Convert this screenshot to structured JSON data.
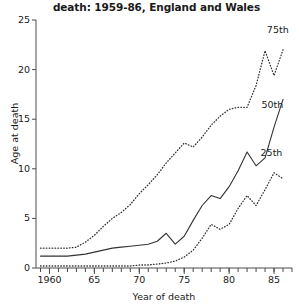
{
  "chart_data": {
    "type": "line",
    "title": "death: 1959-86, England and Wales",
    "subtitle": "",
    "xlabel": "Year of death",
    "ylabel": "Age at death",
    "xlim": [
      1958.5,
      1987.0
    ],
    "ylim": [
      0,
      25
    ],
    "grid": false,
    "legend_position": "inline-right",
    "y_ticks": [
      0,
      5,
      10,
      15,
      20,
      25
    ],
    "y_tick_labels": [
      "0",
      "5",
      "10",
      "15",
      "20",
      "25"
    ],
    "x_ticks": [
      1960,
      1965,
      1970,
      1975,
      1980,
      1985
    ],
    "x_tick_labels": [
      "1960",
      "65",
      "70",
      "75",
      "80",
      "85"
    ],
    "x_minor_tick_step": 1,
    "x": [
      1959,
      1960,
      1961,
      1962,
      1963,
      1964,
      1965,
      1966,
      1967,
      1968,
      1969,
      1970,
      1971,
      1972,
      1973,
      1974,
      1975,
      1976,
      1977,
      1978,
      1979,
      1980,
      1981,
      1982,
      1983,
      1984,
      1985,
      1986
    ],
    "series": [
      {
        "name": "75th",
        "style": "dotted",
        "color": "#333333",
        "label_x": 1984.2,
        "label_y": 24.0,
        "values": [
          2.0,
          2.0,
          2.0,
          2.0,
          2.1,
          2.6,
          3.3,
          4.2,
          5.0,
          5.6,
          6.4,
          7.5,
          8.4,
          9.4,
          10.6,
          11.6,
          12.6,
          12.2,
          13.2,
          14.4,
          15.3,
          16.0,
          16.2,
          16.2,
          18.4,
          21.9,
          19.4,
          22.0
        ]
      },
      {
        "name": "50th",
        "style": "solid",
        "color": "#333333",
        "label_x": 1983.6,
        "label_y": 16.4,
        "values": [
          1.2,
          1.2,
          1.2,
          1.2,
          1.3,
          1.4,
          1.6,
          1.8,
          2.0,
          2.1,
          2.2,
          2.3,
          2.4,
          2.7,
          3.5,
          2.4,
          3.2,
          4.8,
          6.3,
          7.3,
          7.0,
          8.2,
          9.8,
          11.7,
          10.3,
          11.1,
          14.2,
          17.0
        ]
      },
      {
        "name": "25th",
        "style": "dotted",
        "color": "#333333",
        "label_x": 1983.5,
        "label_y": 11.6,
        "values": [
          0.2,
          0.2,
          0.2,
          0.2,
          0.2,
          0.2,
          0.2,
          0.2,
          0.2,
          0.2,
          0.2,
          0.3,
          0.3,
          0.4,
          0.5,
          0.7,
          1.1,
          1.8,
          3.0,
          4.4,
          3.9,
          4.4,
          6.0,
          7.3,
          6.3,
          7.9,
          9.6,
          9.0
        ]
      }
    ]
  }
}
